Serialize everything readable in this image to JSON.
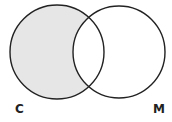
{
  "diagram": {
    "type": "venn",
    "sets": [
      {
        "id": "C",
        "label": "C",
        "cx": 57,
        "cy": 52,
        "r": 47
      },
      {
        "id": "M",
        "label": "M",
        "cx": 119,
        "cy": 52,
        "r": 46
      }
    ],
    "shaded_region": "C only",
    "colors": {
      "shade": "#e6e6e6",
      "stroke": "#222222",
      "background": "#ffffff"
    }
  }
}
